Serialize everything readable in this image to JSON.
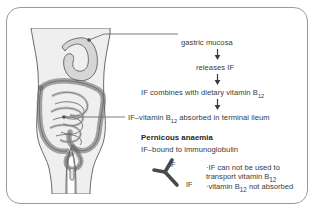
{
  "figure": {
    "title_alt": "Intrinsic factor and vitamin B12 absorption; pernicious anaemia",
    "background": "#ffffff",
    "frame_color": "#9a9a9a",
    "text_color": "#3a3a3a",
    "organ_fill": "#d6d6d6",
    "body_fill": "#efefef",
    "outline_color": "#6b6b6b"
  },
  "flow": {
    "steps": [
      {
        "id": "gastric-mucosa",
        "text": "gastric mucosa"
      },
      {
        "id": "releases-if",
        "text": "releases IF"
      },
      {
        "id": "combines",
        "text_before": "IF combines with dietary vitamin B",
        "sub": "12",
        "text_after": ""
      },
      {
        "id": "absorbed",
        "text_before": "IF–vitamin B",
        "sub": "12",
        "text_after": " absorbed in terminal ileum"
      }
    ],
    "arrow_glyph": "down-arrow"
  },
  "pernicious": {
    "heading": "Pernicous anaemia",
    "subtitle": "IF–bound to immunoglobulin",
    "antibody_label_top": "IF",
    "antibody_label_bottom": "IF",
    "bullets": [
      {
        "id": "bullet-1",
        "text": "·IF can not be used to"
      },
      {
        "id": "bullet-2",
        "text": "  transport vitamin B",
        "sub": "12"
      },
      {
        "id": "bullet-3",
        "text": "·vitamin B",
        "sub": "12",
        "text_after": " not absorbed"
      }
    ]
  },
  "labels": {
    "anatomy_alt": "human torso with stomach, small intestine and colon",
    "pointer_stomach": "gastric mucosa pointer",
    "pointer_ileum": "terminal ileum pointer"
  }
}
